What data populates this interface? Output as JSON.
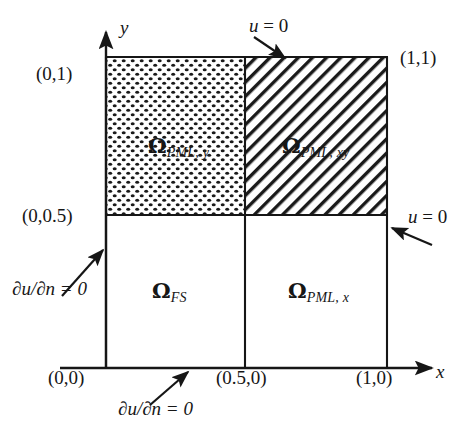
{
  "figure": {
    "background": "#ffffff",
    "line_color": "#161616",
    "axes": {
      "x_label": "x",
      "y_label": "y",
      "x_axis_y_px": 368,
      "y_axis_x_px": 106
    },
    "domain_box": {
      "left_px": 106,
      "right_px": 387,
      "top_px": 57,
      "bottom_px": 368,
      "divider_x_px": 245,
      "divider_y_px": 215
    },
    "corner_labels": [
      {
        "name": "origin",
        "text": "(0,0)"
      },
      {
        "name": "top-left",
        "text": "(0,1)"
      },
      {
        "name": "mid-left",
        "text": "(0,0.5)"
      },
      {
        "name": "top-right",
        "text": "(1,1)"
      },
      {
        "name": "bottom-mid",
        "text": "(0.5,0)"
      },
      {
        "name": "bottom-right",
        "text": "(1,0)"
      }
    ],
    "regions": [
      {
        "id": "pml-y",
        "symbol": "Ω",
        "subscript": "PML, y",
        "fill": "dotted",
        "position": "top-left"
      },
      {
        "id": "pml-xy",
        "symbol": "Ω",
        "subscript": "PML, xy",
        "fill": "diagonal-hatch",
        "position": "top-right"
      },
      {
        "id": "fs",
        "symbol": "Ω",
        "subscript": "FS",
        "fill": "none",
        "position": "bottom-left"
      },
      {
        "id": "pml-x",
        "symbol": "Ω",
        "subscript": "PML, x",
        "fill": "none",
        "position": "bottom-right"
      }
    ],
    "boundary_conditions": [
      {
        "id": "dirichlet-top",
        "text": "u = 0",
        "symbol": "u",
        "rhs": "= 0"
      },
      {
        "id": "dirichlet-right",
        "text": "u = 0",
        "symbol": "u",
        "rhs": "= 0"
      },
      {
        "id": "neumann-left",
        "text": "∂u/∂n = 0",
        "symbol": "∂u/∂n",
        "rhs": "= 0"
      },
      {
        "id": "neumann-bottom",
        "text": "∂u/∂n = 0",
        "symbol": "∂u/∂n",
        "rhs": "= 0"
      }
    ]
  }
}
